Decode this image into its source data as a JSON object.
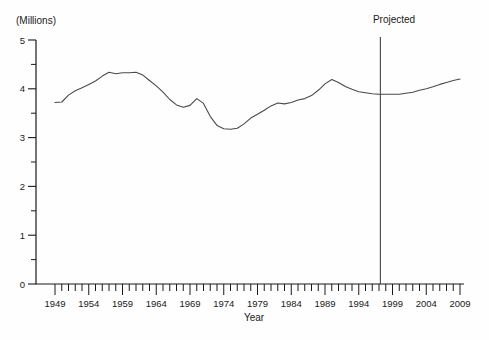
{
  "chart_data": {
    "type": "line",
    "title": "",
    "ylabel": "(Millions)",
    "xlabel": "Year",
    "ylim": [
      0,
      5
    ],
    "xlim": [
      1949,
      2009
    ],
    "y_major_ticks": [
      0,
      1,
      2,
      3,
      4,
      5
    ],
    "y_minor_step": 0.5,
    "x_label_ticks": [
      1949,
      1954,
      1959,
      1964,
      1969,
      1974,
      1979,
      1984,
      1989,
      1994,
      1999,
      2004,
      2009
    ],
    "x_minor_step": 1,
    "grid": "off",
    "legend": "none",
    "annotation": {
      "label": "Projected",
      "year": 1997.2
    },
    "axis_color": "#1a1a1a",
    "line_color": "#4a4a4a",
    "projection_line_color": "#333333",
    "series": [
      {
        "name": "millions-per-year",
        "x": [
          1949,
          1950,
          1951,
          1952,
          1953,
          1954,
          1955,
          1956,
          1957,
          1958,
          1959,
          1960,
          1961,
          1962,
          1963,
          1964,
          1965,
          1966,
          1967,
          1968,
          1969,
          1970,
          1971,
          1972,
          1973,
          1974,
          1975,
          1976,
          1977,
          1978,
          1979,
          1980,
          1981,
          1982,
          1983,
          1984,
          1985,
          1986,
          1987,
          1988,
          1989,
          1990,
          1991,
          1992,
          1993,
          1994,
          1995,
          1996,
          1997,
          1998,
          1999,
          2000,
          2001,
          2002,
          2003,
          2004,
          2005,
          2006,
          2007,
          2008,
          2009
        ],
        "values": [
          3.72,
          3.73,
          3.87,
          3.96,
          4.02,
          4.09,
          4.16,
          4.26,
          4.34,
          4.31,
          4.33,
          4.33,
          4.34,
          4.28,
          4.17,
          4.06,
          3.93,
          3.78,
          3.67,
          3.62,
          3.66,
          3.8,
          3.7,
          3.43,
          3.25,
          3.18,
          3.17,
          3.19,
          3.28,
          3.4,
          3.48,
          3.56,
          3.65,
          3.71,
          3.69,
          3.72,
          3.77,
          3.8,
          3.86,
          3.97,
          4.1,
          4.19,
          4.13,
          4.05,
          3.99,
          3.94,
          3.92,
          3.9,
          3.89,
          3.89,
          3.89,
          3.89,
          3.91,
          3.93,
          3.97,
          4.0,
          4.04,
          4.09,
          4.13,
          4.17,
          4.2
        ]
      }
    ]
  }
}
